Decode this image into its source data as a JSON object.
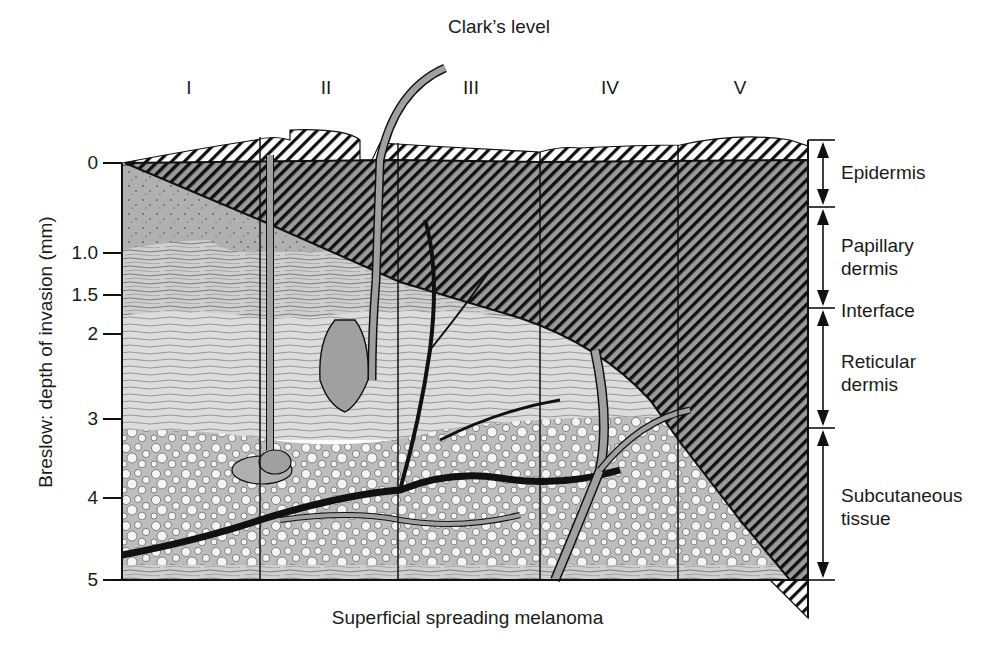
{
  "figure": {
    "top_title": "Clark’s level",
    "caption": "Superficial spreading melanoma",
    "y_axis_label": "Breslow: depth of invasion (mm)",
    "clark_levels": [
      {
        "label": "I",
        "x": 189
      },
      {
        "label": "II",
        "x": 326
      },
      {
        "label": "III",
        "x": 471
      },
      {
        "label": "IV",
        "x": 610
      },
      {
        "label": "V",
        "x": 740
      }
    ],
    "breslow_ticks": [
      {
        "label": "0",
        "y": 163
      },
      {
        "label": "1.0",
        "y": 253
      },
      {
        "label": "1.5",
        "y": 295
      },
      {
        "label": "2",
        "y": 334
      },
      {
        "label": "3",
        "y": 419
      },
      {
        "label": "4",
        "y": 498
      },
      {
        "label": "5",
        "y": 580
      }
    ],
    "skin_layers": [
      {
        "label_line1": "Epidermis",
        "label_line2": "",
        "top": 140,
        "bottom": 207
      },
      {
        "label_line1": "Papillary",
        "label_line2": "dermis",
        "top": 207,
        "bottom": 308
      },
      {
        "label_line1": "Interface",
        "label_line2": "",
        "top": 308,
        "bottom": 308
      },
      {
        "label_line1": "Reticular",
        "label_line2": "dermis",
        "top": 308,
        "bottom": 428
      },
      {
        "label_line1": "Subcutaneous",
        "label_line2": "tissue",
        "top": 428,
        "bottom": 580
      }
    ],
    "colors": {
      "ink": "#111111",
      "papillary_gray": "#b8b8b8",
      "reticular_gray": "#d2d2d2",
      "fat_bg": "#e4e4e4",
      "hair_gray": "#a0a0a0"
    }
  }
}
